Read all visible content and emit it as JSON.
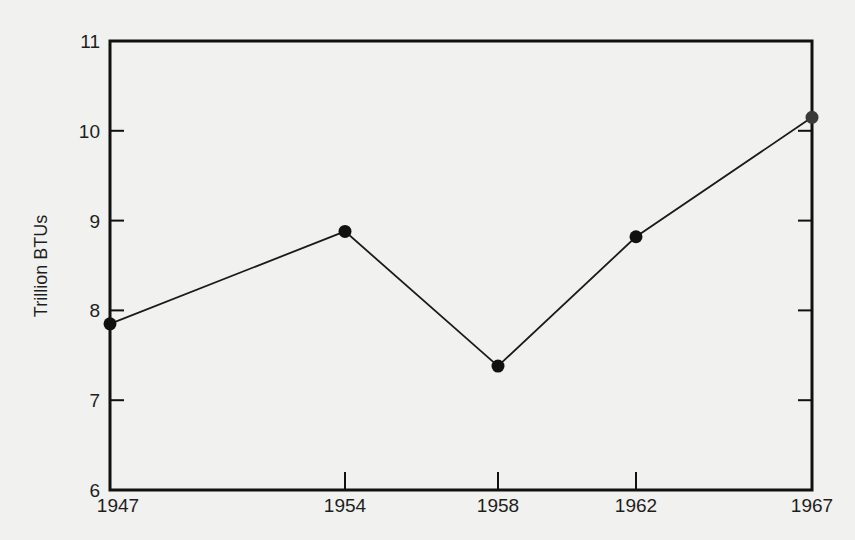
{
  "chart_data": {
    "type": "line",
    "title": "",
    "xlabel": "",
    "ylabel": "Trillion BTUs",
    "categories": [
      "1947",
      "1954",
      "1958",
      "1962",
      "1967"
    ],
    "values": [
      7.85,
      8.88,
      7.38,
      8.82,
      10.15
    ],
    "ylim": [
      6,
      11
    ],
    "yticks": [
      6,
      7,
      8,
      9,
      10,
      11
    ],
    "grid": false,
    "legend": null,
    "markers": true,
    "colors": {
      "line": "#1a1a1a",
      "marker": "#111111",
      "frame": "#111111",
      "background": "#f1f1ef"
    }
  }
}
